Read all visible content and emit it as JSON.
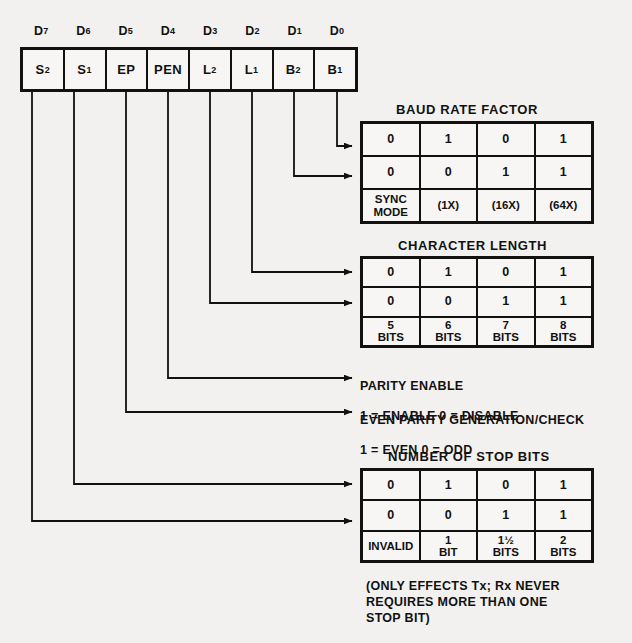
{
  "diagram": {
    "colors": {
      "ink": "#111111",
      "paper": "#f2f1ef",
      "cell": "#f7f6f4"
    },
    "register": {
      "bit_labels": [
        "D7",
        "D6",
        "D5",
        "D4",
        "D3",
        "D2",
        "D1",
        "D0"
      ],
      "bit_label_bases": [
        "D",
        "D",
        "D",
        "D",
        "D",
        "D",
        "D",
        "D"
      ],
      "bit_label_subs": [
        "7",
        "6",
        "5",
        "4",
        "3",
        "2",
        "1",
        "0"
      ],
      "cells": [
        {
          "base": "S",
          "sub": "2"
        },
        {
          "base": "S",
          "sub": "1"
        },
        {
          "base": "EP",
          "sub": ""
        },
        {
          "base": "PEN",
          "sub": ""
        },
        {
          "base": "L",
          "sub": "2"
        },
        {
          "base": "L",
          "sub": "1"
        },
        {
          "base": "B",
          "sub": "2"
        },
        {
          "base": "B",
          "sub": "1"
        }
      ]
    },
    "tables": [
      {
        "id": "baud-rate-factor",
        "title": "BAUD RATE FACTOR",
        "source_bits": [
          "D1",
          "D0"
        ],
        "rows": [
          [
            "0",
            "1",
            "0",
            "1"
          ],
          [
            "0",
            "0",
            "1",
            "1"
          ],
          [
            "SYNC\nMODE",
            "(1X)",
            "(16X)",
            "(64X)"
          ]
        ]
      },
      {
        "id": "character-length",
        "title": "CHARACTER LENGTH",
        "source_bits": [
          "D3",
          "D2"
        ],
        "rows": [
          [
            "0",
            "1",
            "0",
            "1"
          ],
          [
            "0",
            "0",
            "1",
            "1"
          ],
          [
            "5\nBITS",
            "6\nBITS",
            "7\nBITS",
            "8\nBITS"
          ]
        ]
      },
      {
        "id": "number-of-stop-bits",
        "title": "NUMBER OF STOP BITS",
        "source_bits": [
          "D7",
          "D6"
        ],
        "rows": [
          [
            "0",
            "1",
            "0",
            "1"
          ],
          [
            "0",
            "0",
            "1",
            "1"
          ],
          [
            "INVALID",
            "1\nBIT",
            "1½\nBITS",
            "2\nBITS"
          ]
        ]
      }
    ],
    "text_blocks": [
      {
        "id": "parity-enable",
        "source_bit": "D4",
        "line1": "PARITY ENABLE",
        "line2": "1 = ENABLE     0 = DISABLE"
      },
      {
        "id": "even-parity",
        "source_bit": "D5",
        "line1": "EVEN PARITY GENERATION/CHECK",
        "line2": "1 = EVEN        0 = ODD"
      }
    ],
    "footnote": "(ONLY EFFECTS Tx; Rx NEVER\nREQUIRES MORE THAN ONE\nSTOP BIT)"
  }
}
